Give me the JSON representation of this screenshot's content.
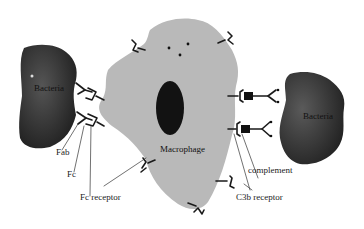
{
  "diagram": {
    "colors": {
      "background": "#ffffff",
      "macrophage": "#b8b8b8",
      "nucleus": "#141414",
      "bacteria_dark": "#2a2a2a",
      "bacteria_mid": "#4a4a4a",
      "stroke": "#1a1a1a",
      "label_text": "#222222"
    },
    "cells": {
      "macrophage": {
        "label": "Macrophage"
      },
      "bacteria_left": {
        "label": "Bacteria"
      },
      "bacteria_right": {
        "label": "Bacteria"
      }
    },
    "labels": {
      "fab": "Fab",
      "fc": "Fc",
      "fc_receptor": "Fc receptor",
      "complement": "complement",
      "c3b_receptor": "C3b receptor"
    },
    "icons": {
      "fc_receptor_shape": "bracket-receptor",
      "c3b_receptor_shape": "bracket-receptor",
      "antibody_shape": "y-antibody",
      "complement_shape": "filled-square"
    }
  }
}
